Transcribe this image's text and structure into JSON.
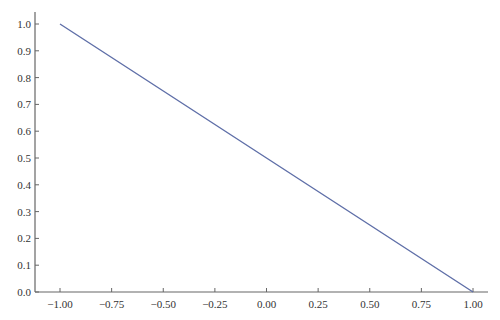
{
  "chart_data": {
    "type": "line",
    "title": "",
    "xlabel": "",
    "ylabel": "",
    "xlim": [
      -1.1,
      1.07
    ],
    "ylim": [
      0.0,
      1.04
    ],
    "grid": false,
    "legend": null,
    "x_ticks": [
      -1.0,
      -0.75,
      -0.5,
      -0.25,
      0.0,
      0.25,
      0.5,
      0.75,
      1.0
    ],
    "x_tick_labels": [
      "−1.00",
      "−0.75",
      "−0.50",
      "−0.25",
      "0.00",
      "0.25",
      "0.50",
      "0.75",
      "1.00"
    ],
    "y_ticks": [
      0.0,
      0.1,
      0.2,
      0.3,
      0.4,
      0.5,
      0.6,
      0.7,
      0.8,
      0.9,
      1.0
    ],
    "y_tick_labels": [
      "0.0",
      "0.1",
      "0.2",
      "0.3",
      "0.4",
      "0.5",
      "0.6",
      "0.7",
      "0.8",
      "0.9",
      "1.0"
    ],
    "series": [
      {
        "name": "line",
        "color": "#5f6fa8",
        "x": [
          -1.0,
          -0.5,
          0.0,
          0.5,
          1.0
        ],
        "y": [
          1.0,
          0.75,
          0.5,
          0.25,
          0.0
        ]
      }
    ]
  },
  "layout": {
    "axis_color": "#666666",
    "plot_px": {
      "x0": 60,
      "x1": 473,
      "y0": 292,
      "y1": 24
    },
    "axis_px": {
      "left": 35,
      "bottom": 292,
      "top": 12,
      "right": 488
    }
  }
}
